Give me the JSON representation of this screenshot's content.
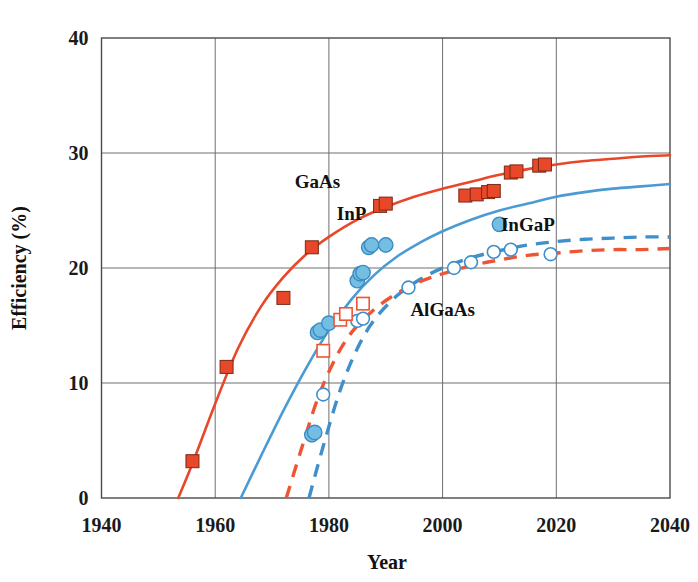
{
  "chart_data": {
    "type": "scatter",
    "title": "",
    "xlabel": "Year",
    "ylabel": "Efficiency (%)",
    "xlim": [
      1940,
      2040
    ],
    "ylim": [
      0,
      40
    ],
    "xticks": [
      1940,
      1960,
      1980,
      2000,
      2020,
      2040
    ],
    "yticks": [
      0,
      10,
      20,
      30,
      40
    ],
    "xtick_labels": [
      "1940",
      "1960",
      "1980",
      "2000",
      "2020",
      "2040"
    ],
    "ytick_labels": [
      "0",
      "10",
      "20",
      "30",
      "40"
    ],
    "grid": true,
    "legend": "inline-annotations",
    "annotations": [
      {
        "text": "GaAs",
        "x": 1978,
        "y": 27.0
      },
      {
        "text": "InP",
        "x": 1984,
        "y": 24.2
      },
      {
        "text": "InGaP",
        "x": 2015,
        "y": 23.2
      },
      {
        "text": "AlGaAs",
        "x": 2000,
        "y": 15.8
      }
    ],
    "colors": {
      "gaas_red": "#E8472A",
      "inp_blue": "#4A9BD4",
      "ingap_blue_dashed": "#3E8FCB",
      "algaas_red_dashed": "#EE5533",
      "grid": "#6e6e6e",
      "frame": "#4a4a4a",
      "text": "#111111",
      "open_marker_fill": "#ffffff"
    },
    "series": [
      {
        "name": "GaAs",
        "marker": "filled-square",
        "color": "#E8472A",
        "line": "solid",
        "points": [
          {
            "x": 1956,
            "y": 3.2
          },
          {
            "x": 1962,
            "y": 11.4
          },
          {
            "x": 1972,
            "y": 17.4
          },
          {
            "x": 1977,
            "y": 21.8
          },
          {
            "x": 1989,
            "y": 25.4
          },
          {
            "x": 1990,
            "y": 25.6
          },
          {
            "x": 2004,
            "y": 26.3
          },
          {
            "x": 2006,
            "y": 26.4
          },
          {
            "x": 2008,
            "y": 26.6
          },
          {
            "x": 2009,
            "y": 26.7
          },
          {
            "x": 2012,
            "y": 28.3
          },
          {
            "x": 2013,
            "y": 28.4
          },
          {
            "x": 2017,
            "y": 28.9
          },
          {
            "x": 2018,
            "y": 29.0
          }
        ],
        "curve": [
          {
            "x": 1953.5,
            "y": 0.0
          },
          {
            "x": 1956,
            "y": 3.0
          },
          {
            "x": 1960,
            "y": 8.2
          },
          {
            "x": 1964,
            "y": 13.0
          },
          {
            "x": 1968,
            "y": 16.6
          },
          {
            "x": 1972,
            "y": 19.2
          },
          {
            "x": 1976,
            "y": 21.2
          },
          {
            "x": 1980,
            "y": 22.7
          },
          {
            "x": 1985,
            "y": 24.2
          },
          {
            "x": 1990,
            "y": 25.3
          },
          {
            "x": 1995,
            "y": 26.2
          },
          {
            "x": 2000,
            "y": 26.9
          },
          {
            "x": 2005,
            "y": 27.5
          },
          {
            "x": 2010,
            "y": 28.1
          },
          {
            "x": 2015,
            "y": 28.6
          },
          {
            "x": 2020,
            "y": 29.0
          },
          {
            "x": 2025,
            "y": 29.3
          },
          {
            "x": 2030,
            "y": 29.5
          },
          {
            "x": 2035,
            "y": 29.7
          },
          {
            "x": 2040,
            "y": 29.8
          }
        ]
      },
      {
        "name": "InP",
        "marker": "filled-circle",
        "color": "#4A9BD4",
        "line": "solid",
        "points": [
          {
            "x": 1977,
            "y": 5.5
          },
          {
            "x": 1977.5,
            "y": 5.7
          },
          {
            "x": 1978,
            "y": 14.4
          },
          {
            "x": 1978.5,
            "y": 14.6
          },
          {
            "x": 1980,
            "y": 15.2
          },
          {
            "x": 1985,
            "y": 18.9
          },
          {
            "x": 1985.5,
            "y": 19.5
          },
          {
            "x": 1986,
            "y": 19.6
          },
          {
            "x": 1987,
            "y": 21.8
          },
          {
            "x": 1987.5,
            "y": 22.0
          },
          {
            "x": 1990,
            "y": 22.0
          },
          {
            "x": 2010,
            "y": 23.8
          }
        ],
        "curve": [
          {
            "x": 1964.5,
            "y": 0.0
          },
          {
            "x": 1968,
            "y": 3.6
          },
          {
            "x": 1972,
            "y": 7.6
          },
          {
            "x": 1976,
            "y": 11.3
          },
          {
            "x": 1980,
            "y": 14.6
          },
          {
            "x": 1984,
            "y": 17.3
          },
          {
            "x": 1988,
            "y": 19.4
          },
          {
            "x": 1992,
            "y": 21.0
          },
          {
            "x": 1996,
            "y": 22.2
          },
          {
            "x": 2000,
            "y": 23.2
          },
          {
            "x": 2005,
            "y": 24.2
          },
          {
            "x": 2010,
            "y": 25.0
          },
          {
            "x": 2015,
            "y": 25.6
          },
          {
            "x": 2020,
            "y": 26.2
          },
          {
            "x": 2025,
            "y": 26.6
          },
          {
            "x": 2030,
            "y": 26.9
          },
          {
            "x": 2035,
            "y": 27.1
          },
          {
            "x": 2040,
            "y": 27.3
          }
        ]
      },
      {
        "name": "InGaP",
        "marker": "open-circle",
        "color": "#3E8FCB",
        "line": "dashed",
        "points": [
          {
            "x": 1979,
            "y": 9.0
          },
          {
            "x": 1985,
            "y": 15.4
          },
          {
            "x": 1986,
            "y": 15.6
          },
          {
            "x": 1994,
            "y": 18.3
          },
          {
            "x": 2002,
            "y": 20.0
          },
          {
            "x": 2005,
            "y": 20.5
          },
          {
            "x": 2009,
            "y": 21.4
          },
          {
            "x": 2012,
            "y": 21.6
          },
          {
            "x": 2019,
            "y": 21.2
          }
        ],
        "curve": [
          {
            "x": 1976.5,
            "y": 0.0
          },
          {
            "x": 1979,
            "y": 4.5
          },
          {
            "x": 1982,
            "y": 9.4
          },
          {
            "x": 1985,
            "y": 13.0
          },
          {
            "x": 1988,
            "y": 15.5
          },
          {
            "x": 1992,
            "y": 17.6
          },
          {
            "x": 1996,
            "y": 19.0
          },
          {
            "x": 2000,
            "y": 20.0
          },
          {
            "x": 2005,
            "y": 20.9
          },
          {
            "x": 2010,
            "y": 21.5
          },
          {
            "x": 2015,
            "y": 22.0
          },
          {
            "x": 2020,
            "y": 22.3
          },
          {
            "x": 2025,
            "y": 22.5
          },
          {
            "x": 2030,
            "y": 22.6
          },
          {
            "x": 2035,
            "y": 22.7
          },
          {
            "x": 2040,
            "y": 22.7
          }
        ]
      },
      {
        "name": "AlGaAs",
        "marker": "open-square",
        "color": "#EE5533",
        "line": "dashed",
        "points": [
          {
            "x": 1979,
            "y": 12.8
          },
          {
            "x": 1982,
            "y": 15.5
          },
          {
            "x": 1983,
            "y": 16.0
          },
          {
            "x": 1986,
            "y": 16.9
          }
        ],
        "curve": [
          {
            "x": 1972.5,
            "y": 0.0
          },
          {
            "x": 1975,
            "y": 4.0
          },
          {
            "x": 1978,
            "y": 8.6
          },
          {
            "x": 1981,
            "y": 12.0
          },
          {
            "x": 1984,
            "y": 14.4
          },
          {
            "x": 1988,
            "y": 16.4
          },
          {
            "x": 1992,
            "y": 17.8
          },
          {
            "x": 1996,
            "y": 18.8
          },
          {
            "x": 2000,
            "y": 19.5
          },
          {
            "x": 2005,
            "y": 20.2
          },
          {
            "x": 2010,
            "y": 20.7
          },
          {
            "x": 2015,
            "y": 21.1
          },
          {
            "x": 2020,
            "y": 21.3
          },
          {
            "x": 2025,
            "y": 21.5
          },
          {
            "x": 2030,
            "y": 21.6
          },
          {
            "x": 2035,
            "y": 21.6
          },
          {
            "x": 2040,
            "y": 21.7
          }
        ]
      }
    ]
  },
  "axis": {
    "x_title": "Year",
    "y_title": "Efficiency (%)"
  }
}
